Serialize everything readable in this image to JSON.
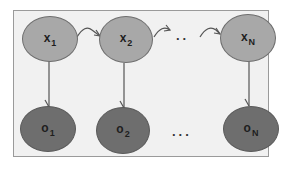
{
  "diagram": {
    "type": "hidden-markov-model",
    "hidden_states": [
      {
        "name": "x",
        "subscript": "1"
      },
      {
        "name": "x",
        "subscript": "2"
      },
      {
        "name": "x",
        "subscript": "N"
      }
    ],
    "observations": [
      {
        "name": "o",
        "subscript": "1"
      },
      {
        "name": "o",
        "subscript": "2"
      },
      {
        "name": "o",
        "subscript": "N"
      }
    ],
    "hidden_ellipsis": "..",
    "observation_ellipsis": "...",
    "colors": {
      "background": "#f1f1f1",
      "border": "#9a9a9a",
      "hidden_fill": "#a8a8a8",
      "observation_fill": "#6e6e6e",
      "edge": "#555555"
    }
  }
}
